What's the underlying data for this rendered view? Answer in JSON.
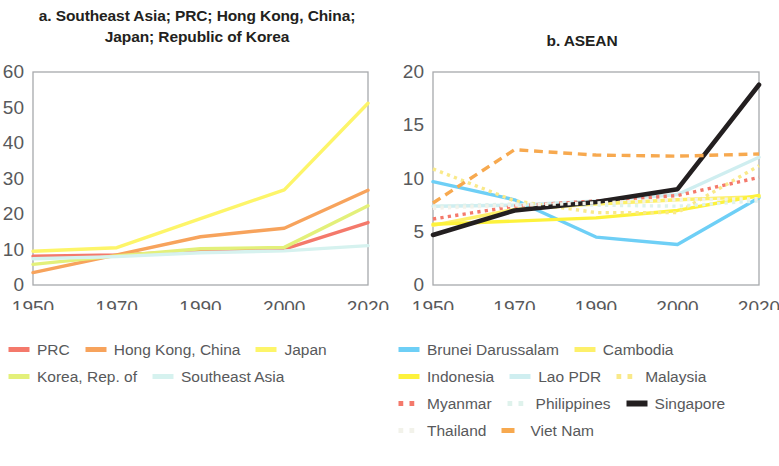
{
  "panel_a": {
    "title": "a. Southeast Asia; PRC; Hong Kong, China;\nJapan; Republic of Korea"
  },
  "panel_b": {
    "title": "b. ASEAN"
  },
  "legend_a": [
    [
      {
        "label": "PRC",
        "color": "#f4796b",
        "dash": "solid"
      },
      {
        "label": "Hong Kong, China",
        "color": "#f7a35c",
        "dash": "solid"
      },
      {
        "label": "Japan",
        "color": "#fdf569",
        "dash": "solid"
      }
    ],
    [
      {
        "label": "Korea, Rep. of",
        "color": "#e3f07a",
        "dash": "solid"
      },
      {
        "label": "Southeast Asia",
        "color": "#d6f2ef",
        "dash": "solid"
      }
    ]
  ],
  "legend_b": [
    [
      {
        "label": "Brunei Darussalam",
        "color": "#6ecff6",
        "dash": "solid"
      },
      {
        "label": "Cambodia",
        "color": "#fdf06a",
        "dash": "solid"
      }
    ],
    [
      {
        "label": "Indonesia",
        "color": "#fdf23c",
        "dash": "solid"
      },
      {
        "label": "Lao PDR",
        "color": "#cfeef0",
        "dash": "solid"
      },
      {
        "label": "Malaysia",
        "color": "#f9e98a",
        "dash": "dotted"
      }
    ],
    [
      {
        "label": "Myanmar",
        "color": "#f4796b",
        "dash": "dotted"
      },
      {
        "label": "Philippines",
        "color": "#dff2ec",
        "dash": "dotted"
      },
      {
        "label": "Singapore",
        "color": "#231f20",
        "dash": "solid"
      }
    ],
    [
      {
        "label": "Thailand",
        "color": "#f2f2ea",
        "dash": "dotted"
      },
      {
        "label": "Viet Nam",
        "color": "#f7a94f",
        "dash": "dashed"
      }
    ]
  ],
  "chart_data": [
    {
      "type": "line",
      "title": "a. Southeast Asia; PRC; Hong Kong, China; Japan; Republic of Korea",
      "xlabel": "",
      "ylabel": "",
      "x": [
        1950,
        1970,
        1990,
        2000,
        2020
      ],
      "xtick_labels": [
        "1950",
        "1970",
        "1990",
        "2000",
        "2020"
      ],
      "ylim": [
        0,
        60
      ],
      "ytick_labels": [
        "0",
        "10",
        "20",
        "30",
        "40",
        "50",
        "60"
      ],
      "grid": false,
      "legend_position": "below",
      "series": [
        {
          "name": "PRC",
          "color": "#f4796b",
          "dash": "solid",
          "values": [
            8.1,
            8.5,
            9.5,
            10.1,
            17.6
          ]
        },
        {
          "name": "Hong Kong, China",
          "color": "#f7a35c",
          "dash": "solid",
          "values": [
            3.5,
            8.5,
            13.6,
            16.0,
            26.7
          ]
        },
        {
          "name": "Japan",
          "color": "#fdf569",
          "dash": "solid",
          "values": [
            9.5,
            10.5,
            18.7,
            26.8,
            51.2
          ]
        },
        {
          "name": "Korea, Rep. of",
          "color": "#e3f07a",
          "dash": "solid",
          "values": [
            5.8,
            8.2,
            10.2,
            10.6,
            22.3
          ]
        },
        {
          "name": "Southeast Asia",
          "color": "#d6f2ef",
          "dash": "solid",
          "values": [
            7.4,
            8.0,
            9.1,
            9.6,
            11.1
          ]
        }
      ]
    },
    {
      "type": "line",
      "title": "b. ASEAN",
      "xlabel": "",
      "ylabel": "",
      "x": [
        1950,
        1970,
        1990,
        2000,
        2020
      ],
      "xtick_labels": [
        "1950",
        "1970",
        "1990",
        "2000",
        "2020"
      ],
      "ylim": [
        0,
        20
      ],
      "ytick_labels": [
        "0",
        "5",
        "10",
        "15",
        "20"
      ],
      "grid": false,
      "legend_position": "below",
      "series": [
        {
          "name": "Brunei Darussalam",
          "color": "#6ecff6",
          "dash": "solid",
          "values": [
            9.7,
            8.0,
            4.5,
            3.8,
            8.2
          ]
        },
        {
          "name": "Cambodia",
          "color": "#fdf06a",
          "dash": "solid",
          "values": [
            5.6,
            7.1,
            7.6,
            8.0,
            8.3
          ]
        },
        {
          "name": "Indonesia",
          "color": "#fdf23c",
          "dash": "solid",
          "values": [
            5.7,
            6.0,
            6.3,
            7.0,
            8.4
          ]
        },
        {
          "name": "Lao PDR",
          "color": "#cfeef0",
          "dash": "solid",
          "values": [
            7.4,
            7.5,
            7.9,
            8.5,
            12.0
          ]
        },
        {
          "name": "Malaysia",
          "color": "#f9e98a",
          "dash": "dotted",
          "values": [
            10.9,
            7.9,
            6.8,
            6.8,
            11.2
          ]
        },
        {
          "name": "Myanmar",
          "color": "#f4796b",
          "dash": "dotted",
          "values": [
            6.2,
            7.4,
            7.9,
            8.4,
            10.1
          ]
        },
        {
          "name": "Philippines",
          "color": "#dff2ec",
          "dash": "dotted",
          "values": [
            7.4,
            7.6,
            7.5,
            7.4,
            7.9
          ]
        },
        {
          "name": "Singapore",
          "color": "#231f20",
          "dash": "solid",
          "values": [
            4.7,
            7.0,
            7.8,
            9.0,
            18.8
          ]
        },
        {
          "name": "Thailand",
          "color": "#f2f2ea",
          "dash": "dotted",
          "values": [
            7.2,
            7.5,
            7.7,
            8.0,
            8.1
          ]
        },
        {
          "name": "Viet Nam",
          "color": "#f7a94f",
          "dash": "dashed",
          "values": [
            7.7,
            12.7,
            12.2,
            12.1,
            12.3
          ]
        }
      ]
    }
  ]
}
